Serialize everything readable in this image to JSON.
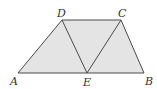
{
  "diagram": {
    "type": "trapezoid-with-triangles",
    "fill_color": "#e4e4e4",
    "stroke_color": "#4a4a4a",
    "points": {
      "A": {
        "x": 18,
        "y": 73
      },
      "E": {
        "x": 87,
        "y": 73
      },
      "B": {
        "x": 144,
        "y": 73
      },
      "D": {
        "x": 62,
        "y": 20
      },
      "C": {
        "x": 121,
        "y": 20
      }
    },
    "labels": {
      "A": "A",
      "B": "B",
      "C": "C",
      "D": "D",
      "E": "E"
    },
    "segments": [
      "AB",
      "BC",
      "CD",
      "DA",
      "DE",
      "EC"
    ]
  }
}
